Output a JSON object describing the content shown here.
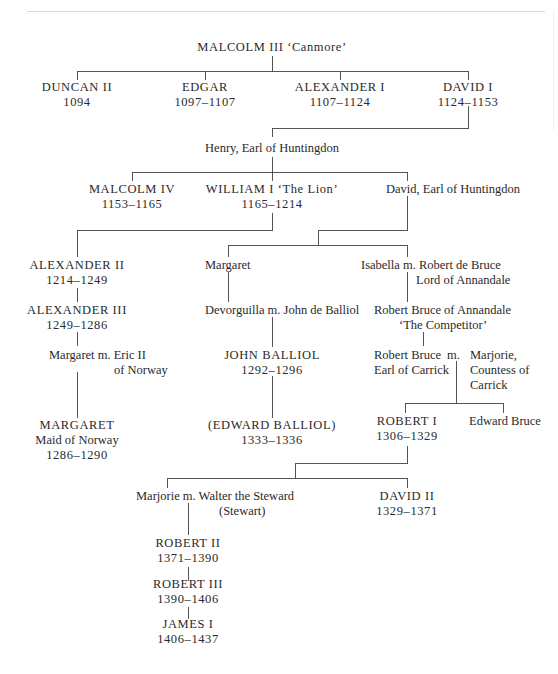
{
  "nodes": {
    "malcolm3": {
      "name": "MALCOLM III ‘Canmore’"
    },
    "duncan2": {
      "name": "DUNCAN II",
      "dates": "1094"
    },
    "edgar": {
      "name": "EDGAR",
      "dates": "1097–1107"
    },
    "alexander1": {
      "name": "ALEXANDER I",
      "dates": "1107–1124"
    },
    "david1": {
      "name": "DAVID I",
      "dates": "1124–1153"
    },
    "henry": {
      "name": "Henry, Earl of Huntingdon"
    },
    "malcolm4": {
      "name": "MALCOLM IV",
      "dates": "1153–1165"
    },
    "william1": {
      "name": "WILLIAM I ‘The Lion’",
      "dates": "1165–1214"
    },
    "david_earl": {
      "name": "David, Earl of Huntingdon"
    },
    "alexander2": {
      "name": "ALEXANDER II",
      "dates": "1214–1249"
    },
    "alexander3": {
      "name": "ALEXANDER III",
      "dates": "1249–1286"
    },
    "margaret_eric": {
      "line1": "Margaret m. Eric II",
      "line2": "of Norway"
    },
    "margaret_maid": {
      "name": "MARGARET",
      "title": "Maid of Norway",
      "dates": "1286–1290"
    },
    "margaret": {
      "name": "Margaret"
    },
    "devorguilla": {
      "name": "Devorguilla m. John de Balliol"
    },
    "john_balliol": {
      "name": "JOHN BALLIOL",
      "dates": "1292–1296"
    },
    "edward_balliol": {
      "name": "(EDWARD BALLIOL)",
      "dates": "1333–1336"
    },
    "isabella": {
      "line1": "Isabella m. Robert de Bruce",
      "line2": "Lord of Annandale"
    },
    "competitor": {
      "line1": "Robert Bruce of Annandale",
      "line2": "‘The Competitor’"
    },
    "robert_carrick": {
      "line1": "Robert Bruce",
      "line2": "Earl of Carrick"
    },
    "marriage": {
      "label": "m."
    },
    "marjorie_carrick": {
      "line1": "Marjorie,",
      "line2": "Countess of",
      "line3": "Carrick"
    },
    "robert1": {
      "name": "ROBERT I",
      "dates": "1306–1329"
    },
    "edward_bruce": {
      "name": "Edward Bruce"
    },
    "marjorie_walter": {
      "line1": "Marjorie m. Walter the Steward",
      "line2": "(Stewart)"
    },
    "david2": {
      "name": "DAVID II",
      "dates": "1329–1371"
    },
    "robert2": {
      "name": "ROBERT II",
      "dates": "1371–1390"
    },
    "robert3": {
      "name": "ROBERT III",
      "dates": "1390–1406"
    },
    "james1": {
      "name": "JAMES I",
      "dates": "1406–1437"
    }
  }
}
